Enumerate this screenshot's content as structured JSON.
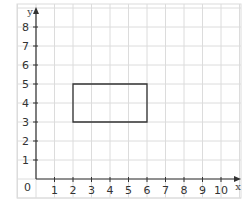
{
  "diagram": {
    "type": "coordinate-grid",
    "x_axis": {
      "label": "x",
      "min": 0,
      "max": 10,
      "ticks": [
        "1",
        "2",
        "3",
        "4",
        "5",
        "6",
        "7",
        "8",
        "9",
        "10"
      ]
    },
    "y_axis": {
      "label": "y",
      "min": 0,
      "max": 8,
      "ticks": [
        "1",
        "2",
        "3",
        "4",
        "5",
        "6",
        "7",
        "8"
      ]
    },
    "origin_label": "0",
    "shapes": [
      {
        "type": "rectangle",
        "vertices": [
          [
            2,
            3
          ],
          [
            6,
            3
          ],
          [
            6,
            5
          ],
          [
            2,
            5
          ]
        ],
        "stroke": "#333333"
      }
    ],
    "colors": {
      "grid": "#dcdcdc",
      "axis": "#333333",
      "shape": "#333333"
    }
  }
}
